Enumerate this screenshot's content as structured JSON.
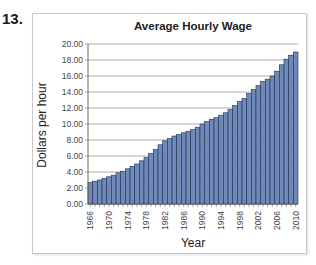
{
  "problem": {
    "number": "13."
  },
  "chart_data": {
    "type": "bar",
    "title": "Average Hourly Wage",
    "xlabel": "Year",
    "ylabel": "Dollars per hour",
    "ylim": [
      0,
      20
    ],
    "yticks": [
      "0.00",
      "2.00",
      "4.00",
      "6.00",
      "8.00",
      "10.00",
      "12.00",
      "14.00",
      "16.00",
      "18.00",
      "20.00"
    ],
    "xtick_labels": [
      "1966",
      "1970",
      "1974",
      "1978",
      "1982",
      "1986",
      "1990",
      "1994",
      "1998",
      "2002",
      "2006",
      "2010"
    ],
    "grid": true,
    "legend": false,
    "bar_color": "#6f8ab8",
    "bar_edge_color": "#1f2f4f",
    "categories": [
      1966,
      1967,
      1968,
      1969,
      1970,
      1971,
      1972,
      1973,
      1974,
      1975,
      1976,
      1977,
      1978,
      1979,
      1980,
      1981,
      1982,
      1983,
      1984,
      1985,
      1986,
      1987,
      1988,
      1989,
      1990,
      1991,
      1992,
      1993,
      1994,
      1995,
      1996,
      1997,
      1998,
      1999,
      2000,
      2001,
      2002,
      2003,
      2004,
      2005,
      2006,
      2007,
      2008,
      2009,
      2010
    ],
    "values": [
      2.7,
      2.85,
      3.0,
      3.2,
      3.4,
      3.6,
      3.9,
      4.1,
      4.4,
      4.7,
      5.0,
      5.4,
      5.8,
      6.3,
      6.8,
      7.4,
      7.9,
      8.2,
      8.5,
      8.7,
      8.9,
      9.1,
      9.3,
      9.6,
      10.0,
      10.3,
      10.6,
      10.8,
      11.1,
      11.4,
      11.8,
      12.3,
      12.8,
      13.2,
      13.8,
      14.3,
      14.8,
      15.3,
      15.6,
      16.0,
      16.6,
      17.4,
      18.1,
      18.6,
      19.0
    ]
  }
}
